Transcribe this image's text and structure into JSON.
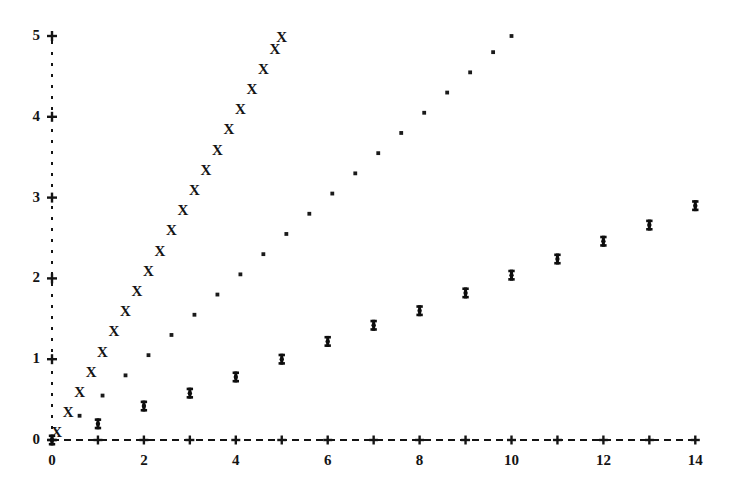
{
  "chart_data": {
    "type": "scatter",
    "title": "",
    "subtitle": "",
    "xlabel": "",
    "ylabel": "",
    "xlim": [
      0,
      14.3
    ],
    "ylim": [
      0,
      5.2
    ],
    "grid": false,
    "legend": "none",
    "axis_style": "ascii-dashed",
    "x_axis": {
      "tick_values": [
        0,
        1,
        2,
        3,
        4,
        5,
        6,
        7,
        8,
        9,
        10,
        11,
        12,
        13,
        14
      ],
      "labeled_ticks": [
        0,
        2,
        4,
        6,
        8,
        10,
        12,
        14
      ],
      "tick_labels": [
        "0",
        "2",
        "4",
        "6",
        "8",
        "10",
        "12",
        "14"
      ],
      "tick_glyph": "+",
      "line_glyph": "dashed"
    },
    "y_axis": {
      "tick_values": [
        0,
        1,
        2,
        3,
        4,
        5
      ],
      "tick_labels": [
        "0",
        "1",
        "2",
        "3",
        "4",
        "5"
      ],
      "tick_glyph": "+",
      "line_glyph": "dotted"
    },
    "series": [
      {
        "name": "linear-x-series",
        "marker": "X",
        "marker_glyph": "X",
        "x": [
          0.1,
          0.35,
          0.6,
          0.85,
          1.1,
          1.35,
          1.6,
          1.85,
          2.1,
          2.35,
          2.6,
          2.85,
          3.1,
          3.35,
          3.6,
          3.85,
          4.1,
          4.35,
          4.6,
          4.85,
          5.0
        ],
        "y": [
          0.1,
          0.35,
          0.6,
          0.85,
          1.1,
          1.35,
          1.6,
          1.85,
          2.1,
          2.35,
          2.6,
          2.85,
          3.1,
          3.35,
          3.6,
          3.85,
          4.1,
          4.35,
          4.6,
          4.85,
          5.0
        ]
      },
      {
        "name": "half-slope-dot-series",
        "marker": ".",
        "marker_glyph": "·",
        "x": [
          0.6,
          1.1,
          1.6,
          2.1,
          2.6,
          3.1,
          3.6,
          4.1,
          4.6,
          5.1,
          5.6,
          6.1,
          6.6,
          7.1,
          7.6,
          8.1,
          8.6,
          9.1,
          9.6,
          10.0
        ],
        "y": [
          0.3,
          0.55,
          0.8,
          1.05,
          1.3,
          1.55,
          1.8,
          2.05,
          2.3,
          2.55,
          2.8,
          3.05,
          3.3,
          3.55,
          3.8,
          4.05,
          4.3,
          4.55,
          4.8,
          5.0
        ]
      },
      {
        "name": "logarithmic-bold-series",
        "marker": "bold-cross",
        "marker_glyph": "‡",
        "x": [
          0,
          1,
          2,
          3,
          4,
          5,
          6,
          7,
          8,
          9,
          10,
          11,
          12,
          13,
          14
        ],
        "y": [
          0.0,
          0.2,
          0.42,
          0.58,
          0.78,
          1.0,
          1.22,
          1.42,
          1.6,
          1.82,
          2.04,
          2.24,
          2.46,
          2.66,
          2.9
        ]
      }
    ]
  },
  "geometry": {
    "x0_px": 52,
    "y0_px": 440,
    "x_scale_px_per_unit": 45.95,
    "y_scale_px_per_unit": 80.8
  }
}
